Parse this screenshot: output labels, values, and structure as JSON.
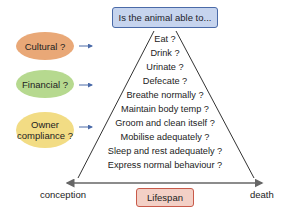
{
  "title": "Is the animal able to...",
  "factors": [
    {
      "label": "Cultural ?",
      "color": "#e9a877"
    },
    {
      "label": "Financial ?",
      "color": "#b6d98f"
    },
    {
      "label": "Owner compliance ?",
      "line1": "Owner",
      "line2": "compliance ?",
      "color": "#f2dc84"
    }
  ],
  "questions": [
    "Eat ?",
    "Drink ?",
    "Urinate ?",
    "Defecate ?",
    "Breathe normally ?",
    "Maintain body temp ?",
    "Groom and clean itself ?",
    "Mobilise adequately ?",
    "Sleep and rest adequately ?",
    "Express normal behaviour ?"
  ],
  "axis": {
    "start": "conception",
    "end": "death",
    "label": "Lifespan"
  },
  "colors": {
    "title_fill": "#c6d4ee",
    "title_border": "#4a6aa8",
    "lifespan_fill": "#f3d0c6",
    "lifespan_border": "#c85a4a",
    "arrow": "#4a6aa8"
  }
}
